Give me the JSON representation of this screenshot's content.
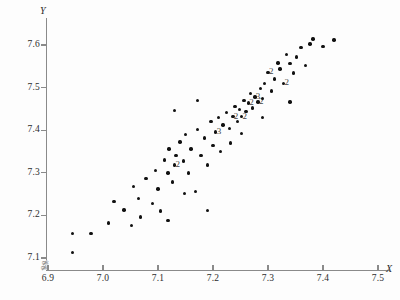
{
  "chart_data": {
    "type": "scatter",
    "title": "",
    "xlabel": "X",
    "ylabel": "Y",
    "xlim": [
      6.85,
      7.52
    ],
    "ylim": [
      7.08,
      7.64
    ],
    "xticks": [
      "6.9",
      "7.0",
      "7.1",
      "7.2",
      "7.3",
      "7.4",
      "7.5"
    ],
    "yticks": [
      "7.1",
      "7.2",
      "7.3",
      "7.4",
      "7.5",
      "7.6"
    ],
    "grid": false,
    "legend": null,
    "axis_break": {
      "x": true,
      "y": true,
      "symbol": "zigzag"
    },
    "marker": {
      "shape": "circle",
      "color": "#111111",
      "size": 3.4
    },
    "multiplicity_note": "Numeric labels beside a marker give the count of coincident observations at that location.",
    "points": [
      {
        "x": 6.945,
        "y": 7.113,
        "n": 1
      },
      {
        "x": 6.944,
        "y": 7.158,
        "n": 1
      },
      {
        "x": 6.978,
        "y": 7.158,
        "n": 1
      },
      {
        "x": 7.01,
        "y": 7.182,
        "n": 1
      },
      {
        "x": 7.02,
        "y": 7.232,
        "n": 1
      },
      {
        "x": 7.038,
        "y": 7.213,
        "n": 1
      },
      {
        "x": 7.055,
        "y": 7.268,
        "n": 1
      },
      {
        "x": 7.065,
        "y": 7.24,
        "n": 1
      },
      {
        "x": 7.068,
        "y": 7.196,
        "n": 1
      },
      {
        "x": 7.078,
        "y": 7.286,
        "n": 1
      },
      {
        "x": 7.09,
        "y": 7.228,
        "n": 1
      },
      {
        "x": 7.095,
        "y": 7.305,
        "n": 1
      },
      {
        "x": 7.1,
        "y": 7.262,
        "n": 1
      },
      {
        "x": 7.104,
        "y": 7.21,
        "n": 1
      },
      {
        "x": 7.112,
        "y": 7.33,
        "n": 1
      },
      {
        "x": 7.118,
        "y": 7.3,
        "n": 1
      },
      {
        "x": 7.12,
        "y": 7.356,
        "n": 1
      },
      {
        "x": 7.126,
        "y": 7.278,
        "n": 1
      },
      {
        "x": 7.13,
        "y": 7.318,
        "n": 2
      },
      {
        "x": 7.133,
        "y": 7.34,
        "n": 1
      },
      {
        "x": 7.14,
        "y": 7.372,
        "n": 1
      },
      {
        "x": 7.146,
        "y": 7.328,
        "n": 1
      },
      {
        "x": 7.15,
        "y": 7.39,
        "n": 1
      },
      {
        "x": 7.155,
        "y": 7.3,
        "n": 1
      },
      {
        "x": 7.16,
        "y": 7.356,
        "n": 1
      },
      {
        "x": 7.168,
        "y": 7.256,
        "n": 1
      },
      {
        "x": 7.172,
        "y": 7.402,
        "n": 1
      },
      {
        "x": 7.178,
        "y": 7.34,
        "n": 1
      },
      {
        "x": 7.184,
        "y": 7.382,
        "n": 1
      },
      {
        "x": 7.19,
        "y": 7.318,
        "n": 1
      },
      {
        "x": 7.196,
        "y": 7.42,
        "n": 1
      },
      {
        "x": 7.2,
        "y": 7.364,
        "n": 1
      },
      {
        "x": 7.205,
        "y": 7.396,
        "n": 3
      },
      {
        "x": 7.21,
        "y": 7.43,
        "n": 1
      },
      {
        "x": 7.214,
        "y": 7.35,
        "n": 1
      },
      {
        "x": 7.218,
        "y": 7.412,
        "n": 1
      },
      {
        "x": 7.224,
        "y": 7.442,
        "n": 1
      },
      {
        "x": 7.23,
        "y": 7.404,
        "n": 1
      },
      {
        "x": 7.236,
        "y": 7.432,
        "n": 2
      },
      {
        "x": 7.24,
        "y": 7.456,
        "n": 1
      },
      {
        "x": 7.244,
        "y": 7.42,
        "n": 1
      },
      {
        "x": 7.248,
        "y": 7.448,
        "n": 1
      },
      {
        "x": 7.252,
        "y": 7.432,
        "n": 2
      },
      {
        "x": 7.256,
        "y": 7.47,
        "n": 1
      },
      {
        "x": 7.26,
        "y": 7.444,
        "n": 1
      },
      {
        "x": 7.264,
        "y": 7.464,
        "n": 2
      },
      {
        "x": 7.268,
        "y": 7.486,
        "n": 1
      },
      {
        "x": 7.272,
        "y": 7.452,
        "n": 1
      },
      {
        "x": 7.276,
        "y": 7.478,
        "n": 3
      },
      {
        "x": 7.282,
        "y": 7.466,
        "n": 2
      },
      {
        "x": 7.286,
        "y": 7.498,
        "n": 1
      },
      {
        "x": 7.29,
        "y": 7.474,
        "n": 1
      },
      {
        "x": 7.294,
        "y": 7.51,
        "n": 1
      },
      {
        "x": 7.3,
        "y": 7.536,
        "n": 2
      },
      {
        "x": 7.306,
        "y": 7.492,
        "n": 1
      },
      {
        "x": 7.312,
        "y": 7.52,
        "n": 1
      },
      {
        "x": 7.318,
        "y": 7.558,
        "n": 1
      },
      {
        "x": 7.322,
        "y": 7.544,
        "n": 1
      },
      {
        "x": 7.328,
        "y": 7.51,
        "n": 2
      },
      {
        "x": 7.334,
        "y": 7.578,
        "n": 1
      },
      {
        "x": 7.34,
        "y": 7.556,
        "n": 1
      },
      {
        "x": 7.346,
        "y": 7.534,
        "n": 1
      },
      {
        "x": 7.352,
        "y": 7.572,
        "n": 1
      },
      {
        "x": 7.36,
        "y": 7.594,
        "n": 1
      },
      {
        "x": 7.368,
        "y": 7.552,
        "n": 1
      },
      {
        "x": 7.376,
        "y": 7.602,
        "n": 1
      },
      {
        "x": 7.382,
        "y": 7.614,
        "n": 1
      },
      {
        "x": 7.4,
        "y": 7.596,
        "n": 1
      },
      {
        "x": 7.42,
        "y": 7.612,
        "n": 1
      },
      {
        "x": 7.13,
        "y": 7.446,
        "n": 1
      },
      {
        "x": 7.172,
        "y": 7.47,
        "n": 1
      },
      {
        "x": 7.052,
        "y": 7.176,
        "n": 1
      },
      {
        "x": 7.148,
        "y": 7.252,
        "n": 1
      },
      {
        "x": 7.19,
        "y": 7.212,
        "n": 1
      },
      {
        "x": 7.118,
        "y": 7.188,
        "n": 1
      },
      {
        "x": 7.232,
        "y": 7.37,
        "n": 1
      },
      {
        "x": 7.252,
        "y": 7.392,
        "n": 1
      },
      {
        "x": 7.29,
        "y": 7.43,
        "n": 1
      },
      {
        "x": 7.34,
        "y": 7.466,
        "n": 1
      }
    ]
  },
  "axes": {
    "y_label": "Y",
    "x_label": "X",
    "break_symbol": "≄"
  }
}
